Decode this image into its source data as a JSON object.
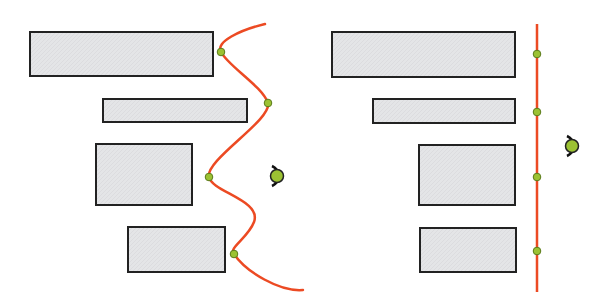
{
  "colors": {
    "background": "#ffffff",
    "block_fill": "#e4e5e7",
    "block_stroke": "#222222",
    "curve": "#ec4a23",
    "dot_fill": "#9cc233",
    "dot_stroke": "#5a7a1a",
    "eye_stroke": "#111111"
  },
  "panels": [
    {
      "name": "curved-alignment",
      "blocks": [
        {
          "x": 30,
          "y": 32,
          "w": 183,
          "h": 44
        },
        {
          "x": 103,
          "y": 99,
          "w": 144,
          "h": 23
        },
        {
          "x": 96,
          "y": 144,
          "w": 96,
          "h": 61
        },
        {
          "x": 128,
          "y": 227,
          "w": 97,
          "h": 45
        }
      ],
      "path": "M 265 24 C 240 30, 215 42, 221 52 C 228 66, 262 86, 268 103 C 272 120, 205 160, 209 177 C 212 192, 262 200, 254 222 C 248 238, 228 248, 234 254 C 246 272, 280 292, 303 290",
      "dots": [
        {
          "x": 221,
          "y": 52
        },
        {
          "x": 268,
          "y": 103
        },
        {
          "x": 209,
          "y": 177
        },
        {
          "x": 234,
          "y": 254
        }
      ],
      "eye": {
        "x": 277,
        "y": 176
      }
    },
    {
      "name": "straight-alignment",
      "blocks": [
        {
          "x": 332,
          "y": 32,
          "w": 183,
          "h": 45
        },
        {
          "x": 373,
          "y": 99,
          "w": 142,
          "h": 24
        },
        {
          "x": 419,
          "y": 145,
          "w": 96,
          "h": 60
        },
        {
          "x": 420,
          "y": 228,
          "w": 96,
          "h": 44
        }
      ],
      "line": {
        "x": 537,
        "y1": 24,
        "y2": 292
      },
      "dots": [
        {
          "x": 537,
          "y": 54
        },
        {
          "x": 537,
          "y": 112
        },
        {
          "x": 537,
          "y": 177
        },
        {
          "x": 537,
          "y": 251
        }
      ],
      "eye": {
        "x": 572,
        "y": 146
      }
    }
  ]
}
